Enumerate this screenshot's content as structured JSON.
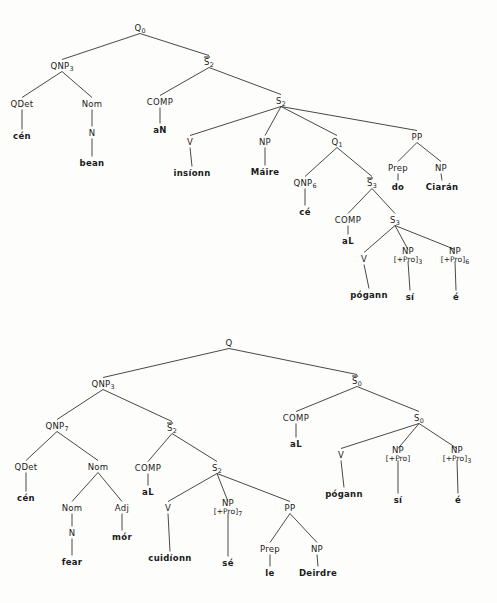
{
  "figure": {
    "tree_count": 2,
    "line_color": "#1a1a1a",
    "text_color": "#1a1a1a",
    "background": "#fdfdfb"
  },
  "trees": [
    {
      "id": "tree-upper",
      "root": "Q0",
      "sentence_terminals": [
        "cén",
        "bean",
        "aN",
        "insíonn",
        "Máire",
        "cé",
        "aL",
        "pógann",
        "sí",
        "é",
        "do",
        "Ciarán"
      ],
      "nodes": [
        {
          "id": "u_q0",
          "label": "Q",
          "sub": "0",
          "overbar": false,
          "x": 140,
          "y": 28,
          "kind": "nonterminal"
        },
        {
          "id": "u_qnp3",
          "label": "QNP",
          "sub": "3",
          "overbar": false,
          "x": 62,
          "y": 66,
          "kind": "nonterminal"
        },
        {
          "id": "u_sbar2",
          "label": "S",
          "sub": "2",
          "overbar": true,
          "x": 209,
          "y": 62,
          "kind": "nonterminal"
        },
        {
          "id": "u_qdet",
          "label": "QDet",
          "sub": "",
          "overbar": false,
          "x": 22,
          "y": 104,
          "kind": "nonterminal"
        },
        {
          "id": "u_nom",
          "label": "Nom",
          "sub": "",
          "overbar": false,
          "x": 92,
          "y": 104,
          "kind": "nonterminal"
        },
        {
          "id": "u_comp1",
          "label": "COMP",
          "sub": "",
          "overbar": false,
          "x": 160,
          "y": 102,
          "kind": "nonterminal"
        },
        {
          "id": "u_s2",
          "label": "S",
          "sub": "2",
          "overbar": false,
          "x": 281,
          "y": 101,
          "kind": "nonterminal"
        },
        {
          "id": "u_cen",
          "label": "cén",
          "sub": "",
          "overbar": false,
          "x": 22,
          "y": 136,
          "kind": "terminal"
        },
        {
          "id": "u_n1",
          "label": "N",
          "sub": "",
          "overbar": false,
          "x": 92,
          "y": 133,
          "kind": "nonterminal"
        },
        {
          "id": "u_an",
          "label": "aN",
          "sub": "",
          "overbar": false,
          "x": 160,
          "y": 130,
          "kind": "terminal"
        },
        {
          "id": "u_v1",
          "label": "V",
          "sub": "",
          "overbar": false,
          "x": 190,
          "y": 142,
          "kind": "nonterminal"
        },
        {
          "id": "u_np1",
          "label": "NP",
          "sub": "",
          "overbar": false,
          "x": 265,
          "y": 142,
          "kind": "nonterminal"
        },
        {
          "id": "u_q1",
          "label": "Q",
          "sub": "1",
          "overbar": false,
          "x": 337,
          "y": 142,
          "kind": "nonterminal"
        },
        {
          "id": "u_pp",
          "label": "PP",
          "sub": "",
          "overbar": false,
          "x": 417,
          "y": 137,
          "kind": "nonterminal"
        },
        {
          "id": "u_bean",
          "label": "bean",
          "sub": "",
          "overbar": false,
          "x": 92,
          "y": 163,
          "kind": "terminal"
        },
        {
          "id": "u_insionn",
          "label": "insíonn",
          "sub": "",
          "overbar": false,
          "x": 192,
          "y": 173,
          "kind": "terminal"
        },
        {
          "id": "u_maire",
          "label": "Máire",
          "sub": "",
          "overbar": false,
          "x": 265,
          "y": 172,
          "kind": "terminal"
        },
        {
          "id": "u_qnp6",
          "label": "QNP",
          "sub": "6",
          "overbar": false,
          "x": 305,
          "y": 183,
          "kind": "nonterminal"
        },
        {
          "id": "u_sbar3",
          "label": "S",
          "sub": "3",
          "overbar": true,
          "x": 372,
          "y": 183,
          "kind": "nonterminal"
        },
        {
          "id": "u_prep1",
          "label": "Prep",
          "sub": "",
          "overbar": false,
          "x": 398,
          "y": 168,
          "kind": "nonterminal"
        },
        {
          "id": "u_np2",
          "label": "NP",
          "sub": "",
          "overbar": false,
          "x": 441,
          "y": 168,
          "kind": "nonterminal"
        },
        {
          "id": "u_do",
          "label": "do",
          "sub": "",
          "overbar": false,
          "x": 398,
          "y": 187,
          "kind": "terminal"
        },
        {
          "id": "u_ciaran",
          "label": "Ciarán",
          "sub": "",
          "overbar": false,
          "x": 442,
          "y": 187,
          "kind": "terminal"
        },
        {
          "id": "u_ce",
          "label": "cé",
          "sub": "",
          "overbar": false,
          "x": 305,
          "y": 212,
          "kind": "terminal"
        },
        {
          "id": "u_comp2",
          "label": "COMP",
          "sub": "",
          "overbar": false,
          "x": 348,
          "y": 220,
          "kind": "nonterminal"
        },
        {
          "id": "u_s3",
          "label": "S",
          "sub": "3",
          "overbar": false,
          "x": 395,
          "y": 220,
          "kind": "nonterminal"
        },
        {
          "id": "u_al1",
          "label": "aL",
          "sub": "",
          "overbar": false,
          "x": 348,
          "y": 241,
          "kind": "terminal"
        },
        {
          "id": "u_v2",
          "label": "V",
          "sub": "",
          "overbar": false,
          "x": 364,
          "y": 259,
          "kind": "nonterminal"
        },
        {
          "id": "u_np3",
          "label": "NP",
          "sub": "3",
          "overbar": false,
          "x": 408,
          "y": 256,
          "kind": "np-pro",
          "feature": "[+Pro]"
        },
        {
          "id": "u_np6",
          "label": "NP",
          "sub": "6",
          "overbar": false,
          "x": 455,
          "y": 256,
          "kind": "np-pro",
          "feature": "[+Pro]"
        },
        {
          "id": "u_pogann",
          "label": "pógann",
          "sub": "",
          "overbar": false,
          "x": 369,
          "y": 295,
          "kind": "terminal"
        },
        {
          "id": "u_si",
          "label": "sí",
          "sub": "",
          "overbar": false,
          "x": 410,
          "y": 297,
          "kind": "terminal"
        },
        {
          "id": "u_e",
          "label": "é",
          "sub": "",
          "overbar": false,
          "x": 456,
          "y": 297,
          "kind": "terminal"
        }
      ],
      "edges": [
        [
          "u_q0",
          "u_qnp3"
        ],
        [
          "u_q0",
          "u_sbar2"
        ],
        [
          "u_qnp3",
          "u_qdet"
        ],
        [
          "u_qnp3",
          "u_nom"
        ],
        [
          "u_sbar2",
          "u_comp1"
        ],
        [
          "u_sbar2",
          "u_s2"
        ],
        [
          "u_qdet",
          "u_cen"
        ],
        [
          "u_nom",
          "u_n1"
        ],
        [
          "u_n1",
          "u_bean"
        ],
        [
          "u_comp1",
          "u_an"
        ],
        [
          "u_s2",
          "u_v1"
        ],
        [
          "u_s2",
          "u_np1"
        ],
        [
          "u_s2",
          "u_q1"
        ],
        [
          "u_s2",
          "u_pp"
        ],
        [
          "u_v1",
          "u_insionn"
        ],
        [
          "u_np1",
          "u_maire"
        ],
        [
          "u_q1",
          "u_qnp6"
        ],
        [
          "u_q1",
          "u_sbar3"
        ],
        [
          "u_pp",
          "u_prep1"
        ],
        [
          "u_pp",
          "u_np2"
        ],
        [
          "u_prep1",
          "u_do"
        ],
        [
          "u_np2",
          "u_ciaran"
        ],
        [
          "u_qnp6",
          "u_ce"
        ],
        [
          "u_sbar3",
          "u_comp2"
        ],
        [
          "u_sbar3",
          "u_s3"
        ],
        [
          "u_comp2",
          "u_al1"
        ],
        [
          "u_s3",
          "u_v2"
        ],
        [
          "u_s3",
          "u_np3"
        ],
        [
          "u_s3",
          "u_np6"
        ],
        [
          "u_v2",
          "u_pogann"
        ],
        [
          "u_np3",
          "u_si"
        ],
        [
          "u_np6",
          "u_e"
        ]
      ]
    },
    {
      "id": "tree-lower",
      "root": "Q",
      "sentence_terminals": [
        "cén",
        "fear",
        "mór",
        "aL",
        "cuidíonn",
        "sé",
        "le",
        "Deirdre",
        "aL",
        "pógann",
        "sí",
        "é"
      ],
      "nodes": [
        {
          "id": "l_q",
          "label": "Q",
          "sub": "",
          "overbar": false,
          "x": 229,
          "y": 343,
          "kind": "nonterminal"
        },
        {
          "id": "l_qnp3",
          "label": "QNP",
          "sub": "3",
          "overbar": false,
          "x": 103,
          "y": 384,
          "kind": "nonterminal"
        },
        {
          "id": "l_sbar0",
          "label": "S",
          "sub": "0",
          "overbar": true,
          "x": 357,
          "y": 381,
          "kind": "nonterminal"
        },
        {
          "id": "l_qnp7",
          "label": "QNP",
          "sub": "7",
          "overbar": false,
          "x": 57,
          "y": 426,
          "kind": "nonterminal"
        },
        {
          "id": "l_sbar2",
          "label": "S",
          "sub": "2",
          "overbar": true,
          "x": 172,
          "y": 428,
          "kind": "nonterminal"
        },
        {
          "id": "l_comp0",
          "label": "COMP",
          "sub": "",
          "overbar": false,
          "x": 296,
          "y": 418,
          "kind": "nonterminal"
        },
        {
          "id": "l_s0",
          "label": "S",
          "sub": "0",
          "overbar": false,
          "x": 419,
          "y": 418,
          "kind": "nonterminal"
        },
        {
          "id": "l_qdet",
          "label": "QDet",
          "sub": "",
          "overbar": false,
          "x": 26,
          "y": 467,
          "kind": "nonterminal"
        },
        {
          "id": "l_nom1",
          "label": "Nom",
          "sub": "",
          "overbar": false,
          "x": 98,
          "y": 467,
          "kind": "nonterminal"
        },
        {
          "id": "l_comp2",
          "label": "COMP",
          "sub": "",
          "overbar": false,
          "x": 148,
          "y": 468,
          "kind": "nonterminal"
        },
        {
          "id": "l_s2",
          "label": "S",
          "sub": "2",
          "overbar": false,
          "x": 217,
          "y": 468,
          "kind": "nonterminal"
        },
        {
          "id": "l_al0",
          "label": "aL",
          "sub": "",
          "overbar": false,
          "x": 296,
          "y": 444,
          "kind": "terminal"
        },
        {
          "id": "l_v0",
          "label": "V",
          "sub": "",
          "overbar": false,
          "x": 341,
          "y": 455,
          "kind": "nonterminal"
        },
        {
          "id": "l_np0a",
          "label": "NP",
          "sub": "",
          "overbar": false,
          "x": 398,
          "y": 455,
          "kind": "np-pro",
          "feature": "[+Pro]"
        },
        {
          "id": "l_np0b",
          "label": "NP",
          "sub": "3",
          "overbar": false,
          "x": 457,
          "y": 455,
          "kind": "np-pro",
          "feature": "[+Pro]"
        },
        {
          "id": "l_cen",
          "label": "cén",
          "sub": "",
          "overbar": false,
          "x": 26,
          "y": 498,
          "kind": "terminal"
        },
        {
          "id": "l_nom2",
          "label": "Nom",
          "sub": "",
          "overbar": false,
          "x": 72,
          "y": 508,
          "kind": "nonterminal"
        },
        {
          "id": "l_adj",
          "label": "Adj",
          "sub": "",
          "overbar": false,
          "x": 122,
          "y": 508,
          "kind": "nonterminal"
        },
        {
          "id": "l_al2",
          "label": "aL",
          "sub": "",
          "overbar": false,
          "x": 148,
          "y": 492,
          "kind": "terminal"
        },
        {
          "id": "l_v2",
          "label": "V",
          "sub": "",
          "overbar": false,
          "x": 168,
          "y": 508,
          "kind": "nonterminal"
        },
        {
          "id": "l_np7",
          "label": "NP",
          "sub": "7",
          "overbar": false,
          "x": 228,
          "y": 508,
          "kind": "np-pro",
          "feature": "[+Pro]"
        },
        {
          "id": "l_pp",
          "label": "PP",
          "sub": "",
          "overbar": false,
          "x": 290,
          "y": 508,
          "kind": "nonterminal"
        },
        {
          "id": "l_pogann",
          "label": "pógann",
          "sub": "",
          "overbar": false,
          "x": 344,
          "y": 494,
          "kind": "terminal"
        },
        {
          "id": "l_si",
          "label": "sí",
          "sub": "",
          "overbar": false,
          "x": 398,
          "y": 500,
          "kind": "terminal"
        },
        {
          "id": "l_e",
          "label": "é",
          "sub": "",
          "overbar": false,
          "x": 458,
          "y": 500,
          "kind": "terminal"
        },
        {
          "id": "l_n",
          "label": "N",
          "sub": "",
          "overbar": false,
          "x": 72,
          "y": 533,
          "kind": "nonterminal"
        },
        {
          "id": "l_mor",
          "label": "mór",
          "sub": "",
          "overbar": false,
          "x": 122,
          "y": 537,
          "kind": "terminal"
        },
        {
          "id": "l_cuidionn",
          "label": "cuidíonn",
          "sub": "",
          "overbar": false,
          "x": 170,
          "y": 558,
          "kind": "terminal"
        },
        {
          "id": "l_se",
          "label": "sé",
          "sub": "",
          "overbar": false,
          "x": 228,
          "y": 563,
          "kind": "terminal"
        },
        {
          "id": "l_prep",
          "label": "Prep",
          "sub": "",
          "overbar": false,
          "x": 270,
          "y": 549,
          "kind": "nonterminal"
        },
        {
          "id": "l_np_d",
          "label": "NP",
          "sub": "",
          "overbar": false,
          "x": 317,
          "y": 549,
          "kind": "nonterminal"
        },
        {
          "id": "l_fear",
          "label": "fear",
          "sub": "",
          "overbar": false,
          "x": 72,
          "y": 562,
          "kind": "terminal"
        },
        {
          "id": "l_le",
          "label": "le",
          "sub": "",
          "overbar": false,
          "x": 270,
          "y": 573,
          "kind": "terminal"
        },
        {
          "id": "l_deirdre",
          "label": "Deirdre",
          "sub": "",
          "overbar": false,
          "x": 318,
          "y": 573,
          "kind": "terminal"
        }
      ],
      "edges": [
        [
          "l_q",
          "l_qnp3"
        ],
        [
          "l_q",
          "l_sbar0"
        ],
        [
          "l_qnp3",
          "l_qnp7"
        ],
        [
          "l_qnp3",
          "l_sbar2"
        ],
        [
          "l_sbar0",
          "l_comp0"
        ],
        [
          "l_sbar0",
          "l_s0"
        ],
        [
          "l_qnp7",
          "l_qdet"
        ],
        [
          "l_qnp7",
          "l_nom1"
        ],
        [
          "l_sbar2",
          "l_comp2"
        ],
        [
          "l_sbar2",
          "l_s2"
        ],
        [
          "l_comp0",
          "l_al0"
        ],
        [
          "l_s0",
          "l_v0"
        ],
        [
          "l_s0",
          "l_np0a"
        ],
        [
          "l_s0",
          "l_np0b"
        ],
        [
          "l_qdet",
          "l_cen"
        ],
        [
          "l_nom1",
          "l_nom2"
        ],
        [
          "l_nom1",
          "l_adj"
        ],
        [
          "l_comp2",
          "l_al2"
        ],
        [
          "l_s2",
          "l_v2"
        ],
        [
          "l_s2",
          "l_np7"
        ],
        [
          "l_s2",
          "l_pp"
        ],
        [
          "l_v0",
          "l_pogann"
        ],
        [
          "l_np0a",
          "l_si"
        ],
        [
          "l_np0b",
          "l_e"
        ],
        [
          "l_nom2",
          "l_n"
        ],
        [
          "l_adj",
          "l_mor"
        ],
        [
          "l_v2",
          "l_cuidionn"
        ],
        [
          "l_np7",
          "l_se"
        ],
        [
          "l_pp",
          "l_prep"
        ],
        [
          "l_pp",
          "l_np_d"
        ],
        [
          "l_n",
          "l_fear"
        ],
        [
          "l_prep",
          "l_le"
        ],
        [
          "l_np_d",
          "l_deirdre"
        ]
      ]
    }
  ]
}
